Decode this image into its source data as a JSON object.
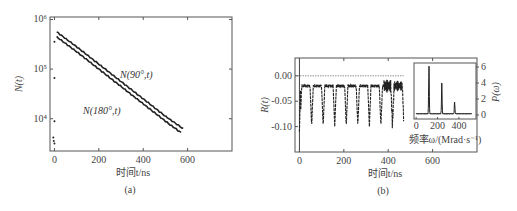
{
  "chart_data": [
    {
      "id": "a",
      "type": "line",
      "panel_label": "(a)",
      "xlabel": "时间t/ns",
      "ylabel": "N(t)",
      "yscale": "log",
      "xlim": [
        -20,
        800
      ],
      "ylim_log10": [
        3.35,
        6.05
      ],
      "xticks": [
        0,
        200,
        400,
        600
      ],
      "xtick_labels": [
        "0",
        "200",
        "400",
        "600"
      ],
      "yticks_log10": [
        4,
        5,
        6
      ],
      "ytick_labels": [
        "10⁴",
        "10⁵",
        "10⁶"
      ],
      "series": [
        {
          "name": "N(90°,t)",
          "annotation": "N(90°,t)",
          "x": [
            10,
            100,
            200,
            300,
            400,
            500,
            580
          ],
          "log10_y": [
            5.75,
            5.45,
            5.1,
            4.75,
            4.4,
            4.05,
            3.8
          ]
        },
        {
          "name": "N(180°,t)",
          "annotation": "N(180°,t)",
          "x": [
            10,
            100,
            200,
            300,
            400,
            500,
            570
          ],
          "log10_y": [
            5.65,
            5.35,
            5.0,
            4.65,
            4.3,
            3.95,
            3.72
          ]
        }
      ],
      "scatter_points": {
        "x": [
          0,
          0,
          0,
          -5,
          -3,
          0
        ],
        "log10_y": [
          5.55,
          4.82,
          3.95,
          3.62,
          3.55,
          3.5
        ]
      }
    },
    {
      "id": "b",
      "type": "line",
      "panel_label": "(b)",
      "xlabel": "时间t/ns",
      "ylabel": "R(t)",
      "xlim": [
        -20,
        800
      ],
      "ylim": [
        -0.15,
        0.035
      ],
      "xticks": [
        0,
        200,
        400,
        600
      ],
      "xtick_labels": [
        "0",
        "200",
        "400",
        "600"
      ],
      "yticks": [
        0.0,
        -0.05,
        -0.1
      ],
      "ytick_labels": [
        "0.00",
        "-0.05",
        "-0.10"
      ],
      "oscillation": {
        "period_ns": 52,
        "baseline": -0.02,
        "dip": -0.1,
        "t_end": 470
      },
      "inset": {
        "type": "line",
        "xlabel": "频率ω/(Mrad·s⁻¹)",
        "ylabel": "P(ω)",
        "xlim": [
          -20,
          560
        ],
        "ylim": [
          -0.5,
          6.5
        ],
        "xticks": [
          0,
          200,
          400
        ],
        "xtick_labels": [
          "0",
          "200",
          "400"
        ],
        "yticks": [
          0,
          2,
          4,
          6
        ],
        "ytick_labels": [
          "0",
          "2",
          "4",
          "6"
        ],
        "peaks": [
          {
            "omega": 120,
            "power": 5.9
          },
          {
            "omega": 240,
            "power": 3.8
          },
          {
            "omega": 360,
            "power": 1.5
          }
        ]
      }
    }
  ]
}
